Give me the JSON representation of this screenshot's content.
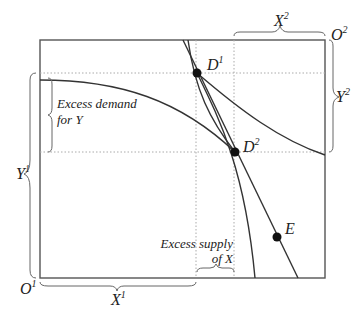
{
  "diagram": {
    "type": "edgeworth-box",
    "origins": {
      "o1": "O",
      "o1_sup": "1",
      "o2": "O",
      "o2_sup": "2"
    },
    "axes": {
      "x1": "X",
      "x1_sup": "1",
      "y1": "Y",
      "y1_sup": "1",
      "x2": "X",
      "x2_sup": "2",
      "y2": "Y",
      "y2_sup": "2"
    },
    "points": [
      {
        "id": "D1",
        "label": "D",
        "sup": "1"
      },
      {
        "id": "D2",
        "label": "D",
        "sup": "2"
      },
      {
        "id": "E",
        "label": "E",
        "sup": ""
      }
    ],
    "annotations": {
      "excess_demand_line1": "Excess demand",
      "excess_demand_line2": "for Y",
      "excess_supply_line1": "Excess supply",
      "excess_supply_line2": "of X"
    },
    "colors": {
      "line": "#333333",
      "dotted": "#aaaaaa",
      "point": "#111111"
    }
  }
}
